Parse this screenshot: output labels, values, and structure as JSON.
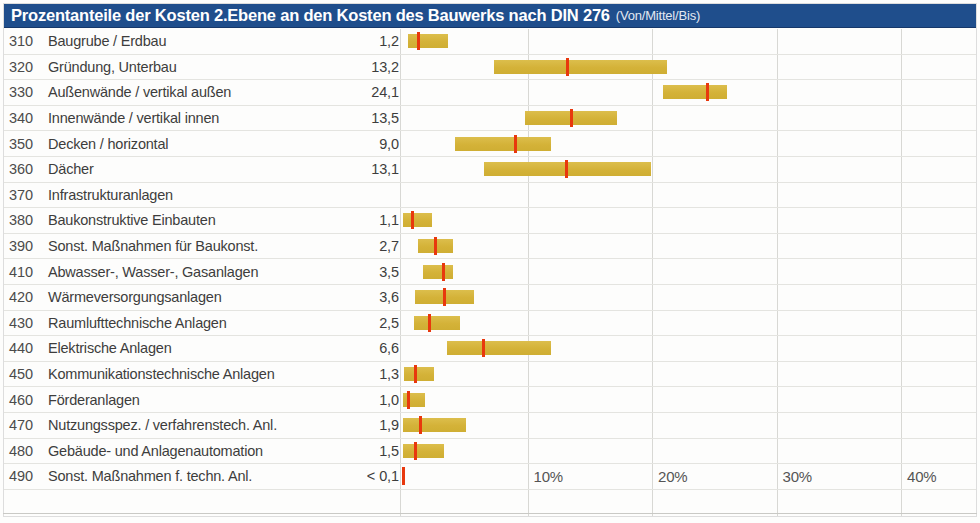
{
  "header": {
    "title": "Prozentanteile der Kosten 2.Ebene an den Kosten des Bauwerks nach DIN 276",
    "subtitle": "(Von/Mittel/Bis)",
    "background_color": "#1f4e8c",
    "text_color": "#ffffff"
  },
  "colors": {
    "bar_fill": "#d9b942",
    "marker": "#e8380d",
    "header_blue": "#1f4e8c",
    "gridline": "#d8d8d4",
    "row_separator": "#e4e4e0",
    "text": "#3d3d3d"
  },
  "chart_data": {
    "type": "bar",
    "title": "Prozentanteile der Kosten 2.Ebene an den Kosten des Bauwerks nach DIN 276",
    "subtitle": "(Von/Mittel/Bis)",
    "xlabel": "",
    "ylabel": "",
    "xlim": [
      0,
      46.5
    ],
    "grid": true,
    "legend": "none",
    "orientation": "horizontal",
    "value_unit": "%",
    "tick_labels": [
      "10%",
      "20%",
      "30%",
      "40%"
    ],
    "tick_values": [
      10,
      20,
      30,
      40
    ],
    "categories": [
      "Baugrube / Erdbau",
      "Gründung, Unterbau",
      "Außenwände / vertikal außen",
      "Innenwände / vertikal innen",
      "Decken / horizontal",
      "Dächer",
      "Infrastrukturanlagen",
      "Baukonstruktive Einbauten",
      "Sonst. Maßnahmen für Baukonst.",
      "Abwasser-, Wasser-, Gasanlagen",
      "Wärmeversorgungsanlagen",
      "Raumlufttechnische Anlagen",
      "Elektrische Anlagen",
      "Kommunikationstechnische Anlagen",
      "Förderanlagen",
      "Nutzungsspez. / verfahrenstech. Anl.",
      "Gebäude- und Anlagenautomation",
      "Sonst. Maßnahmen f. techn. Anl."
    ],
    "codes": [
      "310",
      "320",
      "330",
      "340",
      "350",
      "360",
      "370",
      "380",
      "390",
      "410",
      "420",
      "430",
      "440",
      "450",
      "460",
      "470",
      "480",
      "490"
    ],
    "values": [
      1.2,
      13.2,
      24.1,
      13.5,
      9.0,
      13.1,
      null,
      1.1,
      2.7,
      3.5,
      3.6,
      2.5,
      6.6,
      1.3,
      1.0,
      1.9,
      1.5,
      0.1
    ],
    "series": [
      {
        "name": "Von (low)",
        "values": [
          0.4,
          7.3,
          20.9,
          9.8,
          4.2,
          6.5,
          null,
          0.0,
          1.2,
          1.6,
          1.0,
          0.9,
          3.5,
          0.1,
          0.0,
          0.0,
          0.0,
          0.0
        ]
      },
      {
        "name": "Mittel (mid)",
        "values": [
          1.2,
          13.2,
          24.1,
          13.5,
          9.0,
          13.1,
          null,
          1.1,
          2.7,
          3.5,
          3.6,
          2.5,
          6.6,
          1.3,
          1.0,
          1.9,
          1.5,
          0.0
        ]
      },
      {
        "name": "Bis (high)",
        "values": [
          3.6,
          21.2,
          26.0,
          17.2,
          11.9,
          19.9,
          null,
          2.3,
          4.0,
          4.0,
          5.7,
          4.6,
          11.9,
          2.5,
          1.8,
          5.1,
          3.3,
          0.1
        ]
      }
    ]
  },
  "rows": [
    {
      "code": "310",
      "label": "Baugrube / Erdbau",
      "value": "1,2",
      "low": 0.4,
      "mid": 1.2,
      "high": 3.6,
      "has_bar": true
    },
    {
      "code": "320",
      "label": "Gründung, Unterbau",
      "value": "13,2",
      "low": 7.3,
      "mid": 13.2,
      "high": 21.2,
      "has_bar": true
    },
    {
      "code": "330",
      "label": "Außenwände / vertikal außen",
      "value": "24,1",
      "low": 20.9,
      "mid": 24.4,
      "high": 26.0,
      "has_bar": true
    },
    {
      "code": "340",
      "label": "Innenwände / vertikal innen",
      "value": "13,5",
      "low": 9.8,
      "mid": 13.5,
      "high": 17.2,
      "has_bar": true
    },
    {
      "code": "350",
      "label": "Decken / horizontal",
      "value": "9,0",
      "low": 4.2,
      "mid": 9.0,
      "high": 11.9,
      "has_bar": true
    },
    {
      "code": "360",
      "label": "Dächer",
      "value": "13,1",
      "low": 6.5,
      "mid": 13.1,
      "high": 19.9,
      "has_bar": true
    },
    {
      "code": "370",
      "label": "Infrastrukturanlagen",
      "value": "",
      "low": null,
      "mid": null,
      "high": null,
      "has_bar": false
    },
    {
      "code": "380",
      "label": "Baukonstruktive Einbauten",
      "value": "1,1",
      "low": 0.0,
      "mid": 0.7,
      "high": 2.3,
      "has_bar": true
    },
    {
      "code": "390",
      "label": "Sonst. Maßnahmen für Baukonst.",
      "value": "2,7",
      "low": 1.2,
      "mid": 2.6,
      "high": 4.0,
      "has_bar": true
    },
    {
      "code": "410",
      "label": "Abwasser-, Wasser-, Gasanlagen",
      "value": "3,5",
      "low": 1.6,
      "mid": 3.2,
      "high": 4.0,
      "has_bar": true
    },
    {
      "code": "420",
      "label": "Wärmeversorgungsanlagen",
      "value": "3,6",
      "low": 1.0,
      "mid": 3.3,
      "high": 5.7,
      "has_bar": true
    },
    {
      "code": "430",
      "label": "Raumlufttechnische Anlagen",
      "value": "2,5",
      "low": 0.9,
      "mid": 2.1,
      "high": 4.6,
      "has_bar": true
    },
    {
      "code": "440",
      "label": "Elektrische Anlagen",
      "value": "6,6",
      "low": 3.5,
      "mid": 6.4,
      "high": 11.9,
      "has_bar": true
    },
    {
      "code": "450",
      "label": "Kommunikationstechnische Anlagen",
      "value": "1,3",
      "low": 0.1,
      "mid": 1.0,
      "high": 2.5,
      "has_bar": true
    },
    {
      "code": "460",
      "label": "Förderanlagen",
      "value": "1,0",
      "low": 0.0,
      "mid": 0.4,
      "high": 1.8,
      "has_bar": true
    },
    {
      "code": "470",
      "label": "Nutzungsspez. / verfahrenstech. Anl.",
      "value": "1,9",
      "low": 0.0,
      "mid": 1.4,
      "high": 5.1,
      "has_bar": true
    },
    {
      "code": "480",
      "label": "Gebäude- und Anlagenautomation",
      "value": "1,5",
      "low": 0.0,
      "mid": 1.0,
      "high": 3.3,
      "has_bar": true
    },
    {
      "code": "490",
      "label": "Sonst. Maßnahmen f. techn. Anl.",
      "value": "< 0,1",
      "low": 0.0,
      "mid": 0.0,
      "high": 0.05,
      "has_bar": true
    }
  ],
  "axis": {
    "ticks": [
      {
        "label": "10%",
        "value": 10
      },
      {
        "label": "20%",
        "value": 20
      },
      {
        "label": "30%",
        "value": 30
      },
      {
        "label": "40%",
        "value": 40
      }
    ]
  }
}
